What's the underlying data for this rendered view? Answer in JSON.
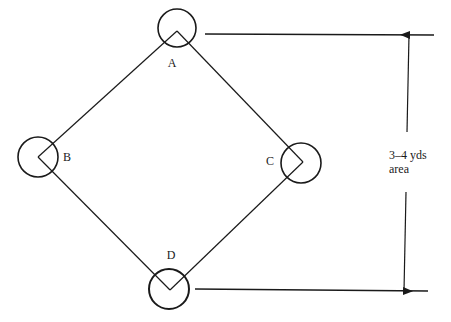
{
  "diagram": {
    "bases": [
      {
        "id": "A",
        "label": "A",
        "cx": 177,
        "cy": 28,
        "r": 19,
        "vx": 177,
        "vy": 31,
        "lx": 172,
        "ly": 67
      },
      {
        "id": "B",
        "label": "B",
        "cx": 38,
        "cy": 157,
        "r": 20,
        "vx": 38,
        "vy": 157,
        "lx": 67,
        "ly": 161
      },
      {
        "id": "C",
        "label": "C",
        "cx": 301,
        "cy": 163,
        "r": 20,
        "vx": 303,
        "vy": 162,
        "lx": 270,
        "ly": 165
      },
      {
        "id": "D",
        "label": "D",
        "cx": 169,
        "cy": 289,
        "r": 20,
        "vx": 170,
        "vy": 290,
        "lx": 171,
        "ly": 259
      }
    ],
    "measure": {
      "top_line": {
        "x1": 205,
        "y1": 34,
        "x2": 434,
        "y2": 35
      },
      "bottom_line": {
        "x1": 195,
        "y1": 289,
        "x2": 428,
        "y2": 291
      },
      "upper_arrow": {
        "x1": 407,
        "y1": 132,
        "x2": 409,
        "y2": 35
      },
      "lower_arrow": {
        "x1": 406,
        "y1": 192,
        "x2": 404,
        "y2": 291
      },
      "label_line1": "3–4 yds",
      "label_line2": "area",
      "label_x": 389,
      "label_y1": 159,
      "label_y2": 173
    },
    "colors": {
      "ink": "#1a1a1a",
      "background": "#ffffff"
    }
  }
}
